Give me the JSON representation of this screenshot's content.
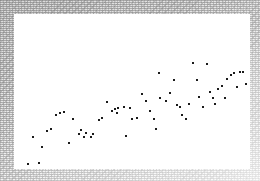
{
  "figure": {
    "width": 260,
    "height": 181,
    "background_color": "#ffffff",
    "border": {
      "style": "speckled-gray-noise",
      "color": "#e2e2e2",
      "left": 14,
      "top": 14,
      "right": 10,
      "bottom": 12
    }
  },
  "plot_area": {
    "left": 14,
    "top": 14,
    "width": 236,
    "height": 155,
    "background_color": "#ffffff"
  },
  "marker": {
    "shape": "square-dot",
    "size_px": 2,
    "color": "#1a1a1a"
  },
  "chart_data": {
    "type": "scatter",
    "title": "",
    "subtitle": "",
    "xlabel": "",
    "ylabel": "",
    "grid": false,
    "legend": null,
    "axis_ticks": false,
    "axis_labels": false,
    "xlim": [
      14,
      250
    ],
    "ylim": [
      14,
      169
    ],
    "n_points": 62,
    "trend": "positive correlation, increasing left to right",
    "series": [
      {
        "name": "observations",
        "color": "#1a1a1a",
        "points": [
          [
            27,
            163
          ],
          [
            38,
            162
          ],
          [
            41,
            146
          ],
          [
            32,
            136
          ],
          [
            46,
            130
          ],
          [
            50,
            128
          ],
          [
            68,
            142
          ],
          [
            55,
            114
          ],
          [
            59,
            112
          ],
          [
            63,
            111
          ],
          [
            72,
            118
          ],
          [
            78,
            133
          ],
          [
            80,
            129
          ],
          [
            85,
            132
          ],
          [
            83,
            136
          ],
          [
            90,
            136
          ],
          [
            92,
            133
          ],
          [
            98,
            119
          ],
          [
            101,
            117
          ],
          [
            106,
            101
          ],
          [
            111,
            110
          ],
          [
            114,
            108
          ],
          [
            117,
            107
          ],
          [
            116,
            112
          ],
          [
            123,
            106
          ],
          [
            125,
            135
          ],
          [
            129,
            107
          ],
          [
            131,
            118
          ],
          [
            136,
            117
          ],
          [
            141,
            93
          ],
          [
            145,
            100
          ],
          [
            149,
            110
          ],
          [
            153,
            118
          ],
          [
            155,
            128
          ],
          [
            159,
            97
          ],
          [
            158,
            72
          ],
          [
            165,
            100
          ],
          [
            169,
            92
          ],
          [
            173,
            79
          ],
          [
            176,
            104
          ],
          [
            179,
            106
          ],
          [
            181,
            114
          ],
          [
            185,
            118
          ],
          [
            188,
            103
          ],
          [
            192,
            62
          ],
          [
            196,
            79
          ],
          [
            198,
            96
          ],
          [
            202,
            106
          ],
          [
            206,
            63
          ],
          [
            209,
            91
          ],
          [
            212,
            97
          ],
          [
            214,
            103
          ],
          [
            217,
            88
          ],
          [
            221,
            85
          ],
          [
            224,
            97
          ],
          [
            226,
            78
          ],
          [
            230,
            74
          ],
          [
            233,
            72
          ],
          [
            236,
            86
          ],
          [
            239,
            71
          ],
          [
            242,
            71
          ],
          [
            245,
            83
          ]
        ]
      }
    ]
  }
}
